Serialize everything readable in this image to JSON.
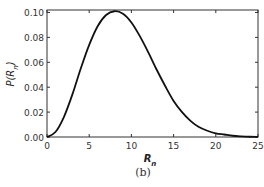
{
  "chart_data": {
    "type": "line",
    "title": "",
    "xlabel": "R_n",
    "ylabel": "P(R_n)",
    "xlim": [
      0,
      25
    ],
    "ylim": [
      0,
      0.102
    ],
    "xticks": [
      0,
      5,
      10,
      15,
      20,
      25
    ],
    "xtick_labels": [
      "0",
      "5",
      "10",
      "15",
      "20",
      "25"
    ],
    "yticks": [
      0.0,
      0.02,
      0.04,
      0.06,
      0.08,
      0.1
    ],
    "ytick_labels": [
      "0.00",
      "0.02",
      "0.04",
      "0.06",
      "0.08",
      "0.10"
    ],
    "grid": false,
    "legend": null,
    "series": [
      {
        "name": "P(R_n)",
        "color": "#111111",
        "x": [
          0,
          1,
          2,
          3,
          4,
          5,
          6,
          7,
          8,
          9,
          10,
          11,
          12,
          13,
          14,
          15,
          16,
          17,
          18,
          19,
          20,
          21,
          22,
          23,
          24,
          25
        ],
        "y": [
          0.0,
          0.004,
          0.016,
          0.034,
          0.055,
          0.074,
          0.089,
          0.098,
          0.101,
          0.099,
          0.092,
          0.081,
          0.068,
          0.054,
          0.041,
          0.029,
          0.02,
          0.013,
          0.008,
          0.005,
          0.003,
          0.002,
          0.001,
          0.0005,
          0.0002,
          0.0001
        ]
      }
    ]
  },
  "caption": "(b)"
}
